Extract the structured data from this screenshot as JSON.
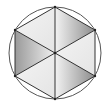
{
  "diagram": {
    "type": "hexagon-inscribed-in-circle",
    "circle": {
      "cx": 55,
      "cy": 53,
      "r": 46,
      "stroke": "#555555"
    },
    "center": {
      "x": 55,
      "y": 53
    },
    "vertices": [
      {
        "x": 55,
        "y": 7
      },
      {
        "x": 95,
        "y": 30
      },
      {
        "x": 95,
        "y": 76
      },
      {
        "x": 55,
        "y": 99
      },
      {
        "x": 15,
        "y": 76
      },
      {
        "x": 15,
        "y": 30
      }
    ],
    "triangles": [
      {
        "name": "upper-right",
        "shade": "dark"
      },
      {
        "name": "right",
        "shade": "light"
      },
      {
        "name": "lower-right",
        "shade": "dark"
      },
      {
        "name": "lower-left",
        "shade": "light"
      },
      {
        "name": "left",
        "shade": "dark"
      },
      {
        "name": "upper-left",
        "shade": "light"
      }
    ],
    "colors": {
      "dark_start": "#f0f0f0",
      "dark_end": "#8a8a8a",
      "light": "#ececec",
      "line": "#333333"
    }
  }
}
